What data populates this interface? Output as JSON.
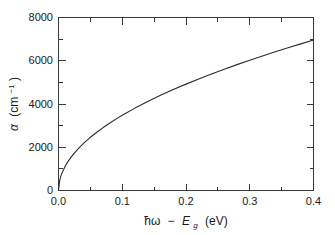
{
  "figure": {
    "background_color": "#ffffff",
    "axis_color": "#3a3a3a",
    "curve_color": "#2b2b2b"
  },
  "chart_data": {
    "type": "line",
    "title": "",
    "xlabel_parts": {
      "hbar_omega": "ħω",
      "minus": "−",
      "E": "E",
      "sub_g": "g",
      "unit": "(eV)"
    },
    "ylabel_parts": {
      "alpha": "α",
      "unit": "(cm",
      "exponent": "−1",
      "unit_close": ")"
    },
    "xlabel": "ħω − E_g (eV)",
    "ylabel": "α (cm⁻¹)",
    "xlim": [
      0.0,
      0.4
    ],
    "ylim": [
      0,
      8000
    ],
    "xticks": [
      0.0,
      0.1,
      0.2,
      0.3,
      0.4
    ],
    "xtick_labels": [
      "0.0",
      "0.1",
      "0.2",
      "0.3",
      "0.4"
    ],
    "yticks": [
      0,
      2000,
      4000,
      6000,
      8000
    ],
    "ytick_labels": [
      "0",
      "2000",
      "4000",
      "6000",
      "8000"
    ],
    "x_minor_step": 0.05,
    "y_minor_step": 1000,
    "grid": false,
    "legend": null,
    "tick_direction": "in",
    "frame": "box",
    "series": [
      {
        "name": "absorption coefficient",
        "relation": "alpha = 11000 * sqrt(hbar*omega - Eg)",
        "x": [
          0.0,
          0.002,
          0.005,
          0.01,
          0.015,
          0.02,
          0.03,
          0.04,
          0.05,
          0.06,
          0.07,
          0.08,
          0.09,
          0.1,
          0.12,
          0.14,
          0.16,
          0.18,
          0.2,
          0.22,
          0.24,
          0.26,
          0.28,
          0.3,
          0.32,
          0.34,
          0.36,
          0.38,
          0.4
        ],
        "values": [
          0,
          492,
          778,
          1100,
          1347,
          1556,
          1905,
          2200,
          2460,
          2694,
          2910,
          3111,
          3300,
          3478,
          3810,
          4115,
          4400,
          4666,
          4919,
          5159,
          5389,
          5610,
          5821,
          6025,
          6223,
          6414,
          6600,
          6781,
          6957
        ]
      }
    ]
  }
}
